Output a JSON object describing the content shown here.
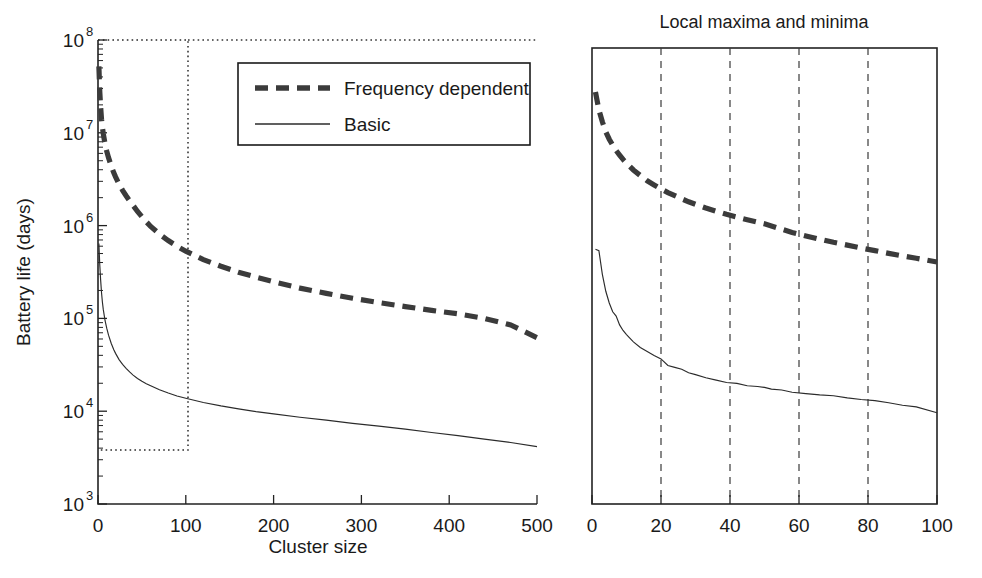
{
  "figure": {
    "background": "#ffffff",
    "ink_color": "#1a1a1a"
  },
  "chart_data": [
    {
      "id": "left",
      "type": "line",
      "title": "",
      "xlabel": "Cluster size",
      "ylabel": "Battery life (days)",
      "xlim": [
        0,
        500
      ],
      "ylim": [
        1000,
        100000000
      ],
      "yscale": "log",
      "xscale": "linear",
      "grid": false,
      "legend_position": "top-right-inside",
      "xticks": [
        "0",
        "100",
        "200",
        "300",
        "400",
        "500"
      ],
      "xtick_values": [
        0,
        100,
        200,
        300,
        400,
        500
      ],
      "yticks": [
        "10^3",
        "10^4",
        "10^5",
        "10^6",
        "10^7",
        "10^8"
      ],
      "ytick_mantissa": [
        "10",
        "10",
        "10",
        "10",
        "10",
        "10"
      ],
      "ytick_exponent": [
        "3",
        "4",
        "5",
        "6",
        "7",
        "8"
      ],
      "ytick_values": [
        1000,
        10000,
        100000,
        1000000,
        10000000,
        100000000
      ],
      "annotations": [
        {
          "name": "zoom-region-box",
          "style": "dotted rectangle",
          "x_range": [
            0,
            103
          ],
          "y_range": [
            4000,
            100000000
          ],
          "note": "marks region expanded in right panel"
        }
      ],
      "series": [
        {
          "name": "Frequency dependent",
          "style": "thick-dashed",
          "color": "#3b3b3b",
          "x": [
            1,
            2,
            3,
            4,
            5,
            6,
            8,
            10,
            12,
            15,
            18,
            20,
            24,
            28,
            32,
            36,
            40,
            45,
            50,
            55,
            60,
            70,
            80,
            90,
            100,
            120,
            140,
            160,
            180,
            200,
            230,
            260,
            290,
            320,
            350,
            380,
            410,
            440,
            470,
            500
          ],
          "y": [
            52000000,
            28000000,
            19000000,
            14000000,
            11500000,
            9800000,
            7600000,
            6300000,
            5400000,
            4400000,
            3700000,
            3350000,
            2800000,
            2400000,
            2100000,
            1850000,
            1650000,
            1420000,
            1250000,
            1100000,
            980000,
            810000,
            690000,
            600000,
            530000,
            430000,
            365000,
            315000,
            278000,
            248000,
            212000,
            186000,
            165000,
            148000,
            134000,
            122000,
            112000,
            100000,
            85000,
            62000
          ]
        },
        {
          "name": "Basic",
          "style": "thin-solid",
          "color": "#2b2b2b",
          "x": [
            1,
            2,
            3,
            4,
            5,
            6,
            8,
            10,
            12,
            15,
            18,
            20,
            24,
            28,
            32,
            36,
            40,
            45,
            50,
            55,
            60,
            70,
            80,
            90,
            100,
            120,
            140,
            160,
            180,
            200,
            230,
            260,
            290,
            320,
            350,
            380,
            410,
            440,
            470,
            500
          ],
          "y": [
            640000,
            380000,
            260000,
            190000,
            150000,
            125000,
            95000,
            78000,
            66000,
            54000,
            46000,
            42000,
            36000,
            32000,
            29000,
            26500,
            24500,
            22500,
            21000,
            19800,
            18800,
            17000,
            15700,
            14600,
            13800,
            12400,
            11400,
            10600,
            9900,
            9350,
            8600,
            8000,
            7400,
            6900,
            6400,
            5900,
            5450,
            5000,
            4600,
            4150
          ]
        }
      ]
    },
    {
      "id": "right",
      "type": "line",
      "title": "Local maxima and minima",
      "xlabel": "",
      "ylabel": "",
      "xlim": [
        0,
        100
      ],
      "ylim": [
        1000,
        100000000
      ],
      "yscale": "log",
      "xscale": "linear",
      "grid": true,
      "gridlines_x": [
        20,
        40,
        60,
        80
      ],
      "grid_style": "dashed-vertical",
      "legend_position": "none",
      "xticks": [
        "0",
        "20",
        "40",
        "60",
        "80",
        "100"
      ],
      "xtick_values": [
        0,
        20,
        40,
        60,
        80,
        100
      ],
      "yticks": [],
      "series": [
        {
          "name": "Frequency dependent",
          "style": "thick-dashed",
          "color": "#3b3b3b",
          "x": [
            1,
            2,
            3,
            4,
            5,
            6,
            7,
            8,
            9,
            10,
            12,
            14,
            16,
            18,
            20,
            22,
            24,
            26,
            28,
            30,
            33,
            36,
            39,
            42,
            45,
            48,
            50,
            52,
            55,
            58,
            62,
            66,
            70,
            74,
            78,
            82,
            86,
            90,
            94,
            100
          ],
          "y": [
            33000000,
            21000000,
            15500000,
            12000000,
            10000000,
            8600000,
            7500000,
            6700000,
            6000000,
            5450000,
            4600000,
            4000000,
            3500000,
            3150000,
            2850000,
            2600000,
            2400000,
            2220000,
            2060000,
            1930000,
            1760000,
            1620000,
            1500000,
            1400000,
            1310000,
            1230000,
            1180000,
            1120000,
            1030000,
            950000,
            870000,
            800000,
            740000,
            690000,
            640000,
            600000,
            560000,
            525000,
            495000,
            450000
          ]
        },
        {
          "name": "Basic",
          "style": "thin-solid",
          "color": "#2b2b2b",
          "x": [
            1,
            2,
            3,
            4,
            5,
            6,
            7,
            8,
            9,
            10,
            12,
            14,
            16,
            18,
            20,
            22,
            24,
            26,
            28,
            30,
            33,
            36,
            39,
            42,
            45,
            48,
            50,
            52,
            55,
            58,
            62,
            66,
            70,
            74,
            78,
            82,
            86,
            90,
            94,
            100
          ],
          "y": [
            620000,
            600000,
            330000,
            215000,
            160000,
            128000,
            115000,
            92000,
            80000,
            72000,
            60000,
            52000,
            47000,
            42500,
            39000,
            33000,
            31500,
            30000,
            27500,
            26200,
            24200,
            22800,
            21500,
            21000,
            19800,
            19400,
            19000,
            18200,
            17800,
            16800,
            16200,
            15700,
            15400,
            14600,
            14000,
            13600,
            12900,
            12100,
            11600,
            10000
          ]
        }
      ]
    }
  ],
  "left_axis": {
    "ylabel": "Battery life (days)",
    "xlabel": "Cluster size"
  },
  "right_axis": {
    "title": "Local maxima and minima"
  },
  "legend": {
    "items": [
      {
        "label": "Frequency dependent",
        "style": "thick-dashed",
        "color": "#3b3b3b"
      },
      {
        "label": "Basic",
        "style": "thin-solid",
        "color": "#2b2b2b"
      }
    ]
  }
}
